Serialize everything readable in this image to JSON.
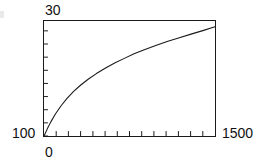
{
  "figure": {
    "ymax_label": "30",
    "ymin_label": "100",
    "xmin_label": "0",
    "xmax_label": "1500"
  },
  "chart_data": {
    "type": "line",
    "title": "",
    "subtitle": "",
    "xlabel": "",
    "ylabel": "",
    "xlim": [
      0,
      1500
    ],
    "ylim": [
      100,
      30
    ],
    "y_axis_inverted": true,
    "y_tick_labels": [
      "30",
      "100"
    ],
    "x_tick_labels": [
      "0",
      "1500"
    ],
    "grid": false,
    "legend": null,
    "annotations": [],
    "axis_ticks": {
      "x_tick_count": 14,
      "y_tick_count": 9,
      "tick_style": "dotted-inward",
      "x_tick_values": [
        0,
        107,
        214,
        321,
        429,
        536,
        643,
        750,
        857,
        964,
        1071,
        1179,
        1286,
        1393
      ],
      "y_tick_values": [
        30,
        38,
        46,
        54,
        62,
        70,
        78,
        86,
        94
      ]
    },
    "series": [
      {
        "name": "decay",
        "x": [
          0,
          30,
          60,
          100,
          150,
          200,
          260,
          320,
          390,
          460,
          540,
          620,
          700,
          790,
          880,
          980,
          1080,
          1180,
          1290,
          1400,
          1500
        ],
        "y": [
          30.0,
          34.5,
          38.6,
          43.4,
          48.4,
          52.7,
          57.1,
          60.9,
          64.7,
          68.0,
          71.4,
          74.4,
          77.1,
          80.0,
          82.5,
          85.1,
          87.5,
          89.7,
          92.0,
          94.3,
          96.5
        ]
      }
    ]
  }
}
